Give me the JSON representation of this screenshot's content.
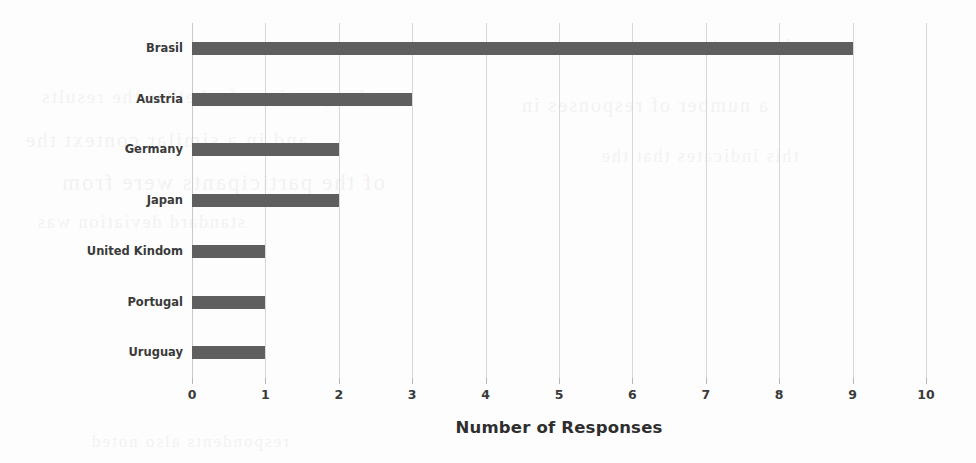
{
  "chart_data": {
    "type": "bar",
    "orientation": "horizontal",
    "title": "",
    "xlabel": "Number of Responses",
    "ylabel": "Countries",
    "categories": [
      "Brasil",
      "Austria",
      "Germany",
      "Japan",
      "United Kindom",
      "Portugal",
      "Uruguay"
    ],
    "values": [
      9,
      3,
      2,
      2,
      1,
      1,
      1
    ],
    "xlim": [
      0,
      10
    ],
    "xticks": [
      "0",
      "1",
      "2",
      "3",
      "4",
      "5",
      "6",
      "7",
      "8",
      "9",
      "10"
    ],
    "grid": "vertical",
    "legend": "none",
    "bar_color": "#5f5f5f",
    "gridline_color": "#d8d8d8",
    "background_color": "#fdfdfd"
  },
  "ghost_text": {
    "lines": [
      "the question of whether the results",
      "and in a similar context the",
      "of the participants were from",
      "standard deviation was",
      "a number of responses in",
      "this indicates that the",
      "research group in",
      "respondents also noted"
    ]
  }
}
